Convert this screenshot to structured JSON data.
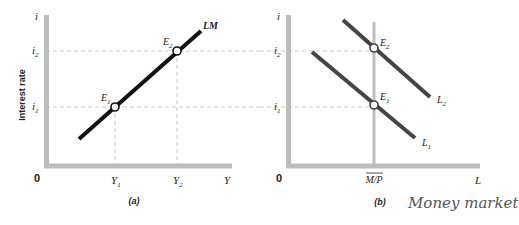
{
  "figure": {
    "panel_a": {
      "caption": "(a)",
      "y_axis": {
        "symbol": "i",
        "title": "Interest rate",
        "ticks": [
          {
            "label": "i",
            "sub": "2"
          },
          {
            "label": "i",
            "sub": "1"
          }
        ]
      },
      "x_axis": {
        "symbol": "Y",
        "origin": "0",
        "ticks": [
          {
            "label": "Y",
            "sub": "1"
          },
          {
            "label": "Y",
            "sub": "2"
          }
        ]
      },
      "curve": {
        "label": "LM",
        "color": "#111111"
      },
      "points": [
        {
          "label": "E",
          "sub": "1"
        },
        {
          "label": "E",
          "sub": "2"
        }
      ]
    },
    "panel_b": {
      "caption": "(b)",
      "annotation": "Money market",
      "y_axis": {
        "symbol": "i",
        "ticks": [
          {
            "label": "i",
            "sub": "2"
          },
          {
            "label": "i",
            "sub": "1"
          }
        ]
      },
      "x_axis": {
        "symbol": "L",
        "origin": "0",
        "supply_label": "M/P"
      },
      "curves": [
        {
          "label": "L",
          "sub": "1",
          "color": "#444444"
        },
        {
          "label": "L",
          "sub": "2",
          "color": "#444444"
        }
      ],
      "points": [
        {
          "label": "E",
          "sub": "1"
        },
        {
          "label": "E",
          "sub": "2"
        }
      ]
    },
    "colors": {
      "axis": "#bdbdbd",
      "dashed": "#c8c8c8",
      "lm": "#111111",
      "demand": "#444444",
      "supply": "#bdbdbd"
    }
  }
}
